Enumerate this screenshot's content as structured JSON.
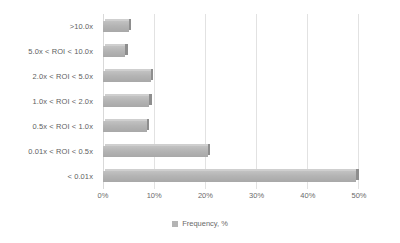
{
  "chart_data": {
    "type": "bar",
    "orientation": "horizontal",
    "title": "",
    "subtitle": "",
    "xlabel": "",
    "ylabel": "",
    "categories": [
      ">10.0x",
      "5.0x < ROI < 10.0x",
      "2.0x < ROI < 5.0x",
      "1.0x < ROI < 2.0x",
      "0.5x < ROI < 1.0x",
      "0.01x < ROI < 0.5x",
      "< 0.01x"
    ],
    "series": [
      {
        "name": "Frequency, %",
        "values": [
          5.0,
          4.3,
          9.3,
          9.0,
          8.5,
          20.5,
          49.5
        ]
      }
    ],
    "xlim": [
      0,
      50
    ],
    "xticks": [
      0,
      10,
      20,
      30,
      40,
      50
    ],
    "xtick_labels": [
      "0%",
      "10%",
      "20%",
      "30%",
      "40%",
      "50%"
    ],
    "grid": true,
    "grid_axis": "x",
    "legend": {
      "entries": [
        "Frequency, %"
      ],
      "position": "bottom"
    },
    "colors": {
      "bar_fill": "#b4b4b4",
      "bar_top": "#cfcfcf",
      "bar_side": "#8e8e8e",
      "gridline": "#e2e2e2",
      "text": "#5e5e5e",
      "background": "#ffffff"
    }
  }
}
